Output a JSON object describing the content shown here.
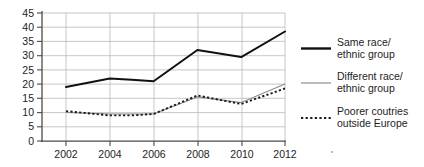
{
  "chart_data": {
    "type": "line",
    "title": "",
    "xlabel": "",
    "ylabel": "",
    "x": [
      2002,
      2003,
      2004,
      2005,
      2006,
      2007,
      2008,
      2009,
      2010,
      2011,
      2012
    ],
    "categories": [
      "2002",
      "2004",
      "2006",
      "2008",
      "2010",
      "2012"
    ],
    "xtick_labels": [
      "2002",
      "2004",
      "2006",
      "2008",
      "2010",
      "2012"
    ],
    "ytick_labels": [
      "0",
      "5",
      "10",
      "15",
      "20",
      "25",
      "30",
      "35",
      "40",
      "45"
    ],
    "yticks": [
      0,
      5,
      10,
      15,
      20,
      25,
      30,
      35,
      40,
      45
    ],
    "ylim": [
      0,
      45
    ],
    "xlim": [
      2002,
      2012
    ],
    "grid": true,
    "legend_position": "right",
    "series": [
      {
        "name": "Same race/ethnic group",
        "style": "solid-thick",
        "color": "#111111",
        "x": [
          2002,
          2004,
          2005,
          2006,
          2008,
          2010,
          2012
        ],
        "values": [
          19,
          22,
          21.5,
          21,
          32,
          29.5,
          38.5
        ]
      },
      {
        "name": "Different race/ethnic group",
        "style": "solid-thin",
        "color": "#8d8d8d",
        "x": [
          2002,
          2004,
          2005,
          2006,
          2008,
          2010,
          2012
        ],
        "values": [
          10,
          9.5,
          9.5,
          9.5,
          15.5,
          13.5,
          20
        ]
      },
      {
        "name": "Poorer coutries outside Europe",
        "style": "dotted",
        "color": "#1a1a1a",
        "x": [
          2002,
          2004,
          2005,
          2006,
          2008,
          2010,
          2012
        ],
        "values": [
          10.5,
          9,
          9,
          9.5,
          16,
          13,
          18.5
        ]
      }
    ]
  },
  "legend": {
    "items": [
      {
        "label_line1": "Same race/",
        "label_line2": "ethnic group",
        "swatch": "solid-thick-line-icon"
      },
      {
        "label_line1": "Different race/",
        "label_line2": "ethnic group",
        "swatch": "solid-thin-line-icon"
      },
      {
        "label_line1": "Poorer coutries",
        "label_line2": "outside Europe",
        "swatch": "dotted-line-icon"
      }
    ]
  },
  "axes": {
    "ytick_labels": [
      "45",
      "40",
      "35",
      "30",
      "25",
      "20",
      "15",
      "10",
      "5",
      "0"
    ],
    "xtick_labels": [
      "2002",
      "2004",
      "2006",
      "2008",
      "2010",
      "2012"
    ]
  },
  "colors": {
    "grid": "#b9b9b9",
    "axis": "#4a4a4a",
    "same_race": "#111111",
    "different_race": "#8d8d8d",
    "poorer_countries": "#1a1a1a",
    "background": "#ffffff"
  }
}
